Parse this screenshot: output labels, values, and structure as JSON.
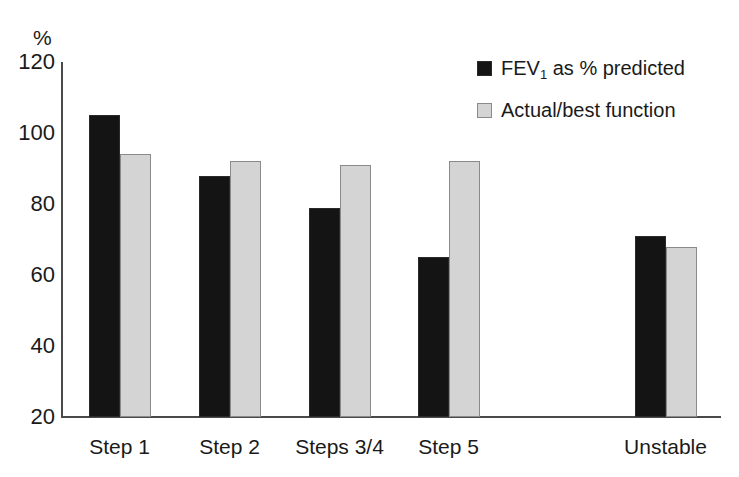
{
  "chart_data": {
    "type": "bar",
    "title": "",
    "subtitle": "",
    "xlabel": "",
    "ylabel": "%",
    "ylim": [
      20,
      120
    ],
    "ytick_labels": [
      "120",
      "100",
      "80",
      "60",
      "40",
      "20"
    ],
    "ytick_values": [
      120,
      100,
      80,
      60,
      40,
      20
    ],
    "grid": false,
    "legend_position": "top-right",
    "categories": [
      "Step 1",
      "Step 2",
      "Steps 3/4",
      "Step 5",
      "Unstable"
    ],
    "series": [
      {
        "name": "FEV1 as % predicted",
        "color": "#141414",
        "values": [
          105,
          88,
          79,
          65,
          71
        ]
      },
      {
        "name": "Actual/best function",
        "color": "#d4d4d4",
        "values": [
          94,
          92,
          91,
          92,
          68
        ]
      }
    ]
  },
  "axis": {
    "unit_label": "%",
    "ticks": [
      {
        "label": "120",
        "value": 120
      },
      {
        "label": "100",
        "value": 100
      },
      {
        "label": "80",
        "value": 80
      },
      {
        "label": "60",
        "value": 60
      },
      {
        "label": "40",
        "value": 40
      },
      {
        "label": "20",
        "value": 20
      }
    ]
  },
  "categories": [
    {
      "label": "Step 1"
    },
    {
      "label": "Step 2"
    },
    {
      "label": "Steps  3/4"
    },
    {
      "label": "Step 5"
    },
    {
      "label": "Unstable"
    }
  ],
  "legend": {
    "items": [
      {
        "label_pre": "FEV",
        "label_sub": "1",
        "label_post": " as % predicted",
        "swatch": "dark-square-icon",
        "color": "#141414"
      },
      {
        "label_pre": "Actual/best function",
        "label_sub": "",
        "label_post": "",
        "swatch": "light-square-icon",
        "color": "#d4d4d4"
      }
    ]
  },
  "colors": {
    "series_dark": "#141414",
    "series_light": "#d4d4d4",
    "axis": "#4a4a4a",
    "text": "#1a1a1a",
    "background": "#ffffff"
  }
}
